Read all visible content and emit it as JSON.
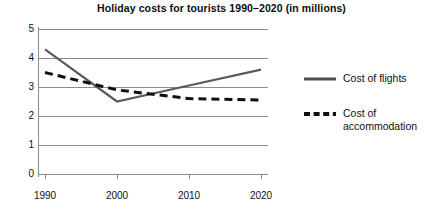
{
  "chart_data": {
    "type": "line",
    "title": "Holiday costs for tourists 1990–2020 (in millions)",
    "xlabel": "",
    "ylabel": "",
    "x": [
      "1990",
      "2000",
      "2010",
      "2020"
    ],
    "categories": [
      "1990",
      "2000",
      "2010",
      "2020"
    ],
    "ylim": [
      0,
      5
    ],
    "yticks": [
      "0",
      "1",
      "2",
      "3",
      "4",
      "5"
    ],
    "grid": "horizontal",
    "legend_position": "right",
    "series": [
      {
        "name": "Cost of flights",
        "values": [
          4.3,
          2.5,
          3.05,
          3.6
        ],
        "style": "solid",
        "color": "#5a5a5a"
      },
      {
        "name": "Cost of accommodation",
        "values": [
          3.5,
          2.9,
          2.6,
          2.55
        ],
        "style": "dashed",
        "color": "#101010"
      }
    ]
  },
  "legend": {
    "items": [
      {
        "label": "Cost of flights",
        "swatch": "solid-line-swatch"
      },
      {
        "label": "Cost of accommodation",
        "swatch": "dashed-line-swatch"
      }
    ]
  },
  "axes": {
    "y_ticks": [
      {
        "label": "5",
        "value": 5
      },
      {
        "label": "4",
        "value": 4
      },
      {
        "label": "3",
        "value": 3
      },
      {
        "label": "2",
        "value": 2
      },
      {
        "label": "1",
        "value": 1
      },
      {
        "label": "0",
        "value": 0
      }
    ],
    "x_ticks": [
      {
        "label": "1990"
      },
      {
        "label": "2000"
      },
      {
        "label": "2010"
      },
      {
        "label": "2020"
      }
    ]
  }
}
